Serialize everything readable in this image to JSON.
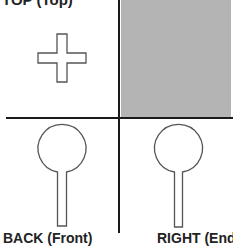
{
  "diagram": {
    "top_label": "TOP (Top)",
    "labels": {
      "back": "BACK (Front)",
      "right": "RIGHT (End)"
    },
    "colors": {
      "line": "#1a1a1a",
      "fill_gray": "#b4b4b4",
      "outline": "#444444"
    },
    "quadrants": [
      {
        "position": "top-left",
        "shape": "plus-sign-outline"
      },
      {
        "position": "top-right",
        "shape": "gray-filled-rectangle"
      },
      {
        "position": "bottom-left",
        "shape": "pin-outline",
        "caption": "BACK (Front)"
      },
      {
        "position": "bottom-right",
        "shape": "pin-outline",
        "caption": "RIGHT (End)"
      }
    ]
  }
}
